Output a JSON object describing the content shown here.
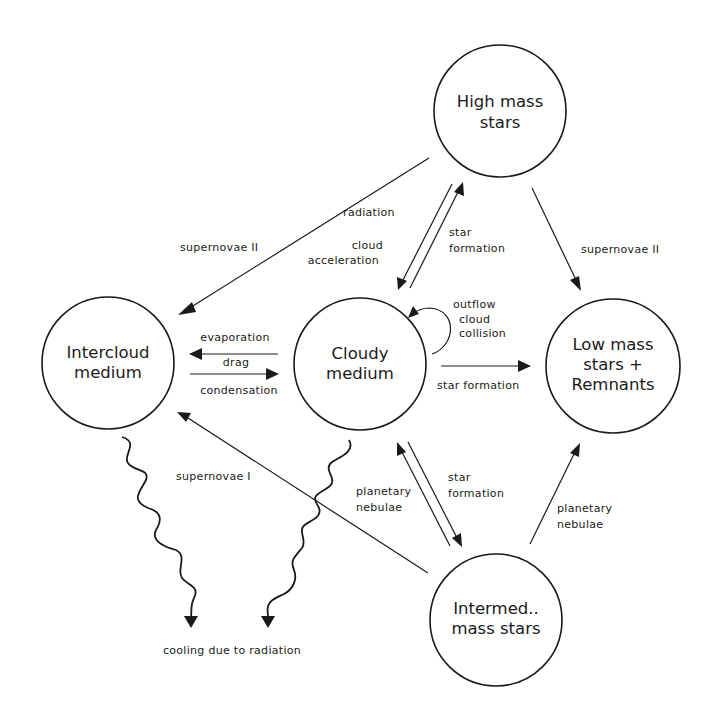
{
  "nodes": {
    "high_mass": {
      "lines": [
        "High mass",
        "stars"
      ]
    },
    "intercloud": {
      "lines": [
        "Intercloud",
        "medium"
      ]
    },
    "cloudy": {
      "lines": [
        "Cloudy",
        "medium"
      ]
    },
    "low_mass": {
      "lines": [
        "Low mass",
        "stars +",
        "Remnants"
      ]
    },
    "intermed": {
      "lines": [
        "Intermed..",
        "mass stars"
      ]
    }
  },
  "edges": {
    "supernovae_ii_left": "supernovae II",
    "supernovae_ii_right": "supernovae II",
    "radiation": [
      "radiation",
      "cloud",
      "acceleration"
    ],
    "star_formation_up": [
      "star",
      "formation"
    ],
    "outflow": [
      "outflow",
      "cloud",
      "collision"
    ],
    "evaporation": "evaporation",
    "drag": "drag",
    "condensation": "condensation",
    "star_formation_right": "star formation",
    "supernovae_i": "supernovae I",
    "planetary_nebulae_left": [
      "planetary",
      "nebulae"
    ],
    "star_formation_down": [
      "star",
      "formation"
    ],
    "planetary_nebulae_right": [
      "planetary",
      "nebulae"
    ],
    "cooling": "cooling due to radiation"
  },
  "colors": {
    "ink": "#1a1a1a",
    "background": "#ffffff"
  }
}
